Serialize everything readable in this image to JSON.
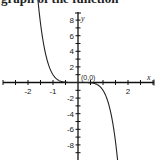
{
  "header": {
    "clipped_text": "graph of the function"
  },
  "chart_data": {
    "type": "line",
    "title": "",
    "function": "y = -x^5",
    "xlabel": "x",
    "ylabel": "y",
    "xlim": [
      -3,
      3
    ],
    "ylim": [
      -10,
      10
    ],
    "x_ticks": [
      -2,
      -1,
      2
    ],
    "y_ticks": [
      8,
      6,
      4,
      2,
      -2,
      -4,
      -6,
      -8
    ],
    "origin_label": "(0,0)",
    "grid": false,
    "series": [
      {
        "name": "f(x)",
        "x": [
          -1.6,
          -1.5,
          -1.4,
          -1.3,
          -1.2,
          -1.1,
          -1.0,
          -0.8,
          -0.6,
          -0.4,
          -0.2,
          0,
          0.2,
          0.4,
          0.6,
          0.8,
          1.0,
          1.1,
          1.2,
          1.3,
          1.4,
          1.5,
          1.6
        ],
        "y": [
          10.49,
          7.59,
          5.38,
          3.71,
          2.49,
          1.61,
          1.0,
          0.33,
          0.08,
          0.01,
          0.0,
          0,
          0.0,
          -0.01,
          -0.08,
          -0.33,
          -1.0,
          -1.61,
          -2.49,
          -3.71,
          -5.38,
          -7.59,
          -10.49
        ]
      }
    ],
    "labels": {
      "x_tick_labels": [
        "-2",
        "-1",
        "2"
      ],
      "y_tick_labels": [
        "8",
        "6",
        "4",
        "2",
        "-2",
        "-4",
        "-6",
        "-8"
      ]
    }
  }
}
